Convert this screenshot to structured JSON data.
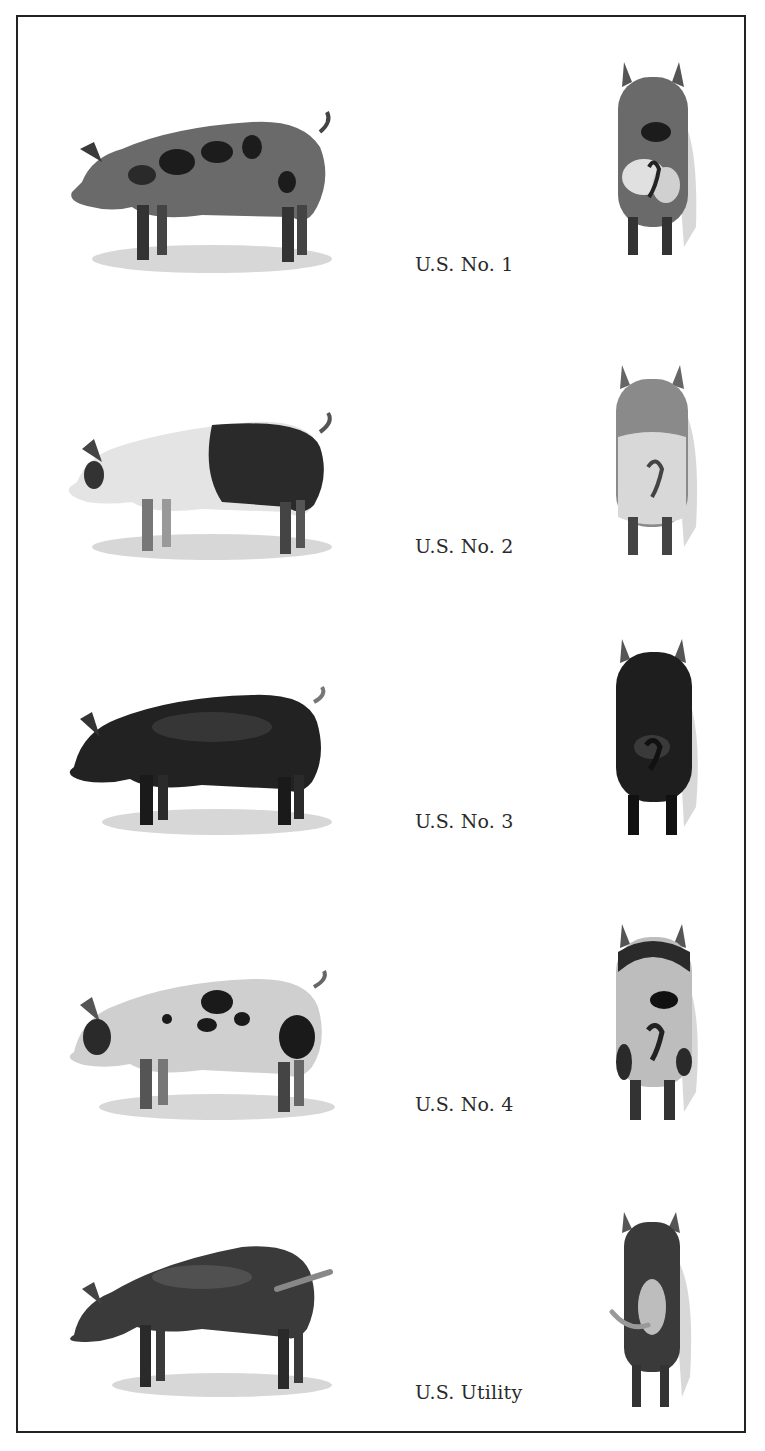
{
  "figure": {
    "title": "",
    "grades": [
      {
        "label": "U.S. No. 1",
        "side_view": "spotted-muscular-pig-side-icon",
        "rear_view": "spotted-pig-rear-icon",
        "body_color": "#4a4a4a",
        "spot_color": "#1c1c1c",
        "base_color": "#8a8a8a"
      },
      {
        "label": "U.S. No. 2",
        "side_view": "belted-pig-side-icon",
        "rear_view": "belted-pig-rear-icon",
        "body_color": "#d8d8d8",
        "spot_color": "#2a2a2a",
        "base_color": "#e6e6e6"
      },
      {
        "label": "U.S. No. 3",
        "side_view": "black-fat-pig-side-icon",
        "rear_view": "black-pig-rear-icon",
        "body_color": "#1e1e1e",
        "spot_color": "#111111",
        "base_color": "#2a2a2a"
      },
      {
        "label": "U.S. No. 4",
        "side_view": "spotted-fat-pig-side-icon",
        "rear_view": "spotted-fat-pig-rear-icon",
        "body_color": "#bdbdbd",
        "spot_color": "#1a1a1a",
        "base_color": "#cfcfcf"
      },
      {
        "label": "U.S. Utility",
        "side_view": "thin-dark-pig-side-icon",
        "rear_view": "thin-pig-rear-icon",
        "body_color": "#3a3a3a",
        "spot_color": "#222222",
        "base_color": "#555555"
      }
    ]
  },
  "colors": {
    "border": "#222222",
    "text": "#2a2a2a",
    "background": "#ffffff",
    "grass": "#9a9a9a"
  }
}
